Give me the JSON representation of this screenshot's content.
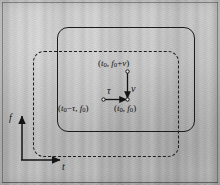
{
  "figure": {
    "background_color": "#c2c2c2",
    "ink_color": "#1b1b1b",
    "width": 220,
    "height": 185
  },
  "axes": {
    "vertical_label": "f",
    "horizontal_label": "t"
  },
  "regions": {
    "solid_rect_name": "ambiguity-support-region",
    "dashed_rect_name": "shifted-support-region"
  },
  "labels": {
    "top_point": {
      "open": "(",
      "t": "t",
      "t_sub": "0",
      "comma": ", ",
      "f": "f",
      "f_sub": "0",
      "plus": "+",
      "nu": "ν",
      "close": ")"
    },
    "bottom_left_point": {
      "open": "(",
      "t": "t",
      "t_sub": "0",
      "minus": "−",
      "tau": "τ",
      "comma": ", ",
      "f": "f",
      "f_sub": "0",
      "close": ")"
    },
    "bottom_right_point": {
      "open": "(",
      "t": "t",
      "t_sub": "0",
      "comma": ", ",
      "f": "f",
      "f_sub": "0",
      "close": ")"
    },
    "tau_offset": "τ",
    "nu_offset": "ν"
  }
}
